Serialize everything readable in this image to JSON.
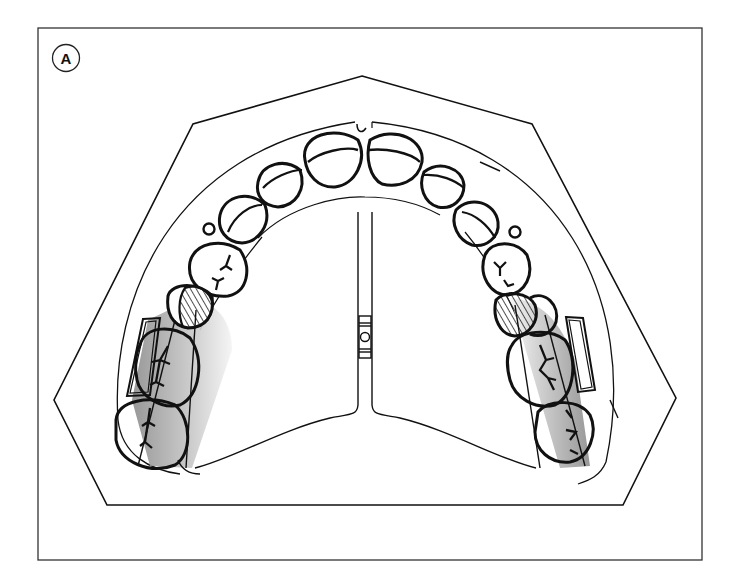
{
  "figure": {
    "panel_label": "A",
    "colors": {
      "line": "#111111",
      "background": "#ffffff",
      "shading_dark": "#9a9a9a",
      "shading_light": "#f2f2f2",
      "hatch": "#222222"
    },
    "elements": [
      "frame",
      "cast-base-outline",
      "anterior-teeth",
      "premolars",
      "hatched-teeth",
      "shaded-molars",
      "expansion-screw",
      "palatal-acrylic-plate",
      "bands"
    ]
  }
}
